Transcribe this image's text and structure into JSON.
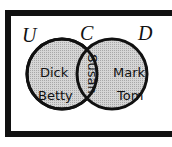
{
  "diagram": {
    "type": "venn",
    "universe_label": "U",
    "sets": [
      {
        "label": "C",
        "members_only": [
          "Dick",
          "Betty"
        ]
      },
      {
        "label": "D",
        "members_only": [
          "Mark",
          "Tom"
        ]
      }
    ],
    "intersection": [
      "Susan"
    ],
    "colors": {
      "fill": "#c8c8c8",
      "stroke": "#111111",
      "frame": "#111111"
    }
  }
}
